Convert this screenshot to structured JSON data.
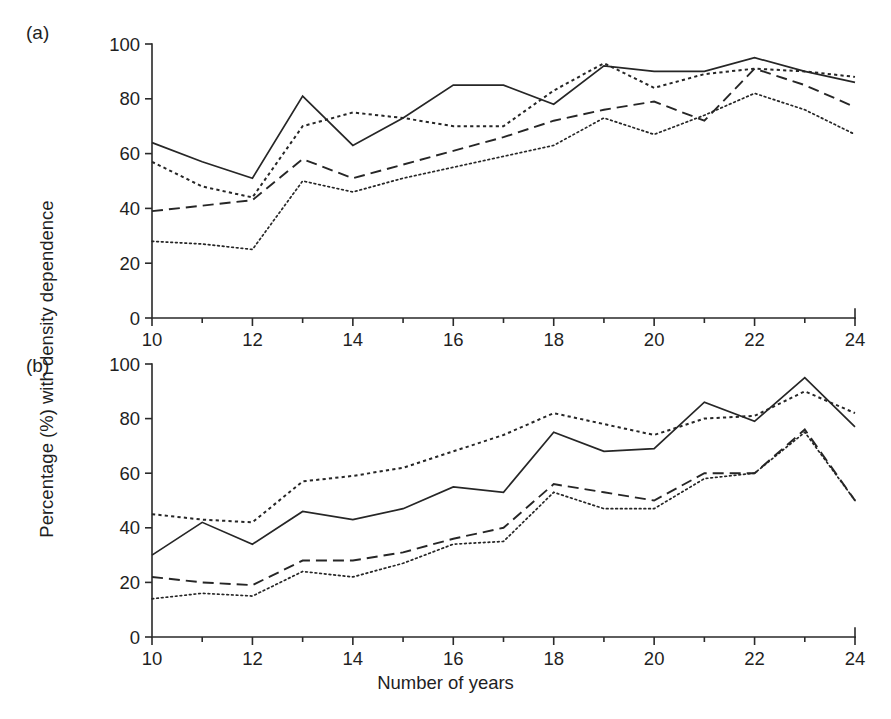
{
  "figure": {
    "panel_a_tag": "(a)",
    "panel_b_tag": "(b)",
    "y_axis_title": "Percentage (%) with density dependence",
    "x_axis_title": "Number of years"
  },
  "chart_data": [
    {
      "type": "line",
      "panel": "(a)",
      "title": "",
      "xlabel": "Number of years",
      "ylabel": "Percentage (%) with density dependence",
      "x": [
        10,
        11,
        12,
        13,
        14,
        15,
        16,
        17,
        18,
        19,
        20,
        21,
        22,
        23,
        24
      ],
      "xlim": [
        10,
        24
      ],
      "ylim": [
        0,
        100
      ],
      "xticks": [
        10,
        12,
        14,
        16,
        18,
        20,
        22,
        24
      ],
      "xtick_labels": [
        "10",
        "12",
        "14",
        "16",
        "18",
        "20",
        "22",
        "24"
      ],
      "xminorticks": [
        11,
        13,
        15,
        17,
        19,
        21,
        23
      ],
      "yticks": [
        0,
        20,
        40,
        60,
        80,
        100
      ],
      "ytick_labels": [
        "0",
        "20",
        "40",
        "60",
        "80",
        "100"
      ],
      "grid": false,
      "legend": "none",
      "series": [
        {
          "name": "solid",
          "style": "solid",
          "values": [
            64,
            57,
            51,
            81,
            63,
            73,
            85,
            85,
            78,
            92,
            90,
            90,
            95,
            90,
            86
          ]
        },
        {
          "name": "coarse-dotted",
          "style": "coarse-dotted",
          "values": [
            57,
            48,
            44,
            70,
            75,
            73,
            70,
            70,
            83,
            93,
            84,
            89,
            91,
            90,
            88
          ]
        },
        {
          "name": "dashed",
          "style": "dashed",
          "values": [
            39,
            41,
            43,
            58,
            51,
            56,
            61,
            66,
            72,
            76,
            79,
            72,
            91,
            85,
            77
          ]
        },
        {
          "name": "fine-dotted",
          "style": "fine-dotted",
          "values": [
            28,
            27,
            25,
            50,
            46,
            51,
            55,
            59,
            63,
            73,
            67,
            74,
            82,
            76,
            67
          ]
        }
      ]
    },
    {
      "type": "line",
      "panel": "(b)",
      "title": "",
      "xlabel": "Number of years",
      "ylabel": "Percentage (%) with density dependence",
      "x": [
        10,
        11,
        12,
        13,
        14,
        15,
        16,
        17,
        18,
        19,
        20,
        21,
        22,
        23,
        24
      ],
      "xlim": [
        10,
        24
      ],
      "ylim": [
        0,
        100
      ],
      "xticks": [
        10,
        12,
        14,
        16,
        18,
        20,
        22,
        24
      ],
      "xtick_labels": [
        "10",
        "12",
        "14",
        "16",
        "18",
        "20",
        "22",
        "24"
      ],
      "xminorticks": [
        11,
        13,
        15,
        17,
        19,
        21,
        23
      ],
      "yticks": [
        0,
        20,
        40,
        60,
        80,
        100
      ],
      "ytick_labels": [
        "0",
        "20",
        "40",
        "60",
        "80",
        "100"
      ],
      "grid": false,
      "legend": "none",
      "series": [
        {
          "name": "coarse-dotted",
          "style": "coarse-dotted",
          "values": [
            45,
            43,
            42,
            57,
            59,
            62,
            68,
            74,
            82,
            78,
            74,
            80,
            81,
            90,
            82
          ]
        },
        {
          "name": "solid",
          "style": "solid",
          "values": [
            30,
            42,
            34,
            46,
            43,
            47,
            55,
            53,
            75,
            68,
            69,
            86,
            79,
            95,
            77
          ]
        },
        {
          "name": "dashed",
          "style": "dashed",
          "values": [
            22,
            20,
            19,
            28,
            28,
            31,
            36,
            40,
            56,
            53,
            50,
            60,
            60,
            76,
            50
          ]
        },
        {
          "name": "fine-dotted",
          "style": "fine-dotted",
          "values": [
            14,
            16,
            15,
            24,
            22,
            27,
            34,
            35,
            53,
            47,
            47,
            58,
            60,
            75,
            50
          ]
        }
      ]
    }
  ]
}
